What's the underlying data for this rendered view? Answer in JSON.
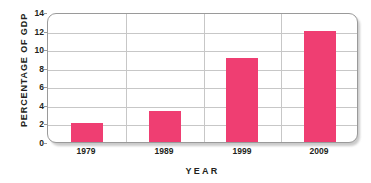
{
  "chart_data": {
    "type": "bar",
    "title": "",
    "categories": [
      "1979",
      "1989",
      "1999",
      "2009"
    ],
    "values": [
      2.0,
      3.3,
      9.0,
      12.0
    ],
    "xlabel": "YEAR",
    "ylabel": "PERCENTAGE OF GDP",
    "ylim": [
      0,
      14
    ],
    "yticks": [
      0,
      2,
      4,
      6,
      8,
      10,
      12,
      14
    ],
    "ytick_labels": [
      "0",
      "2",
      "4",
      "6",
      "8",
      "10",
      "12",
      "14"
    ],
    "grid": {
      "horizontal": true,
      "vertical": true,
      "vertical_count": 3
    },
    "legend": null,
    "series": [
      {
        "name": "Percentage of GDP",
        "values": [
          2.0,
          3.3,
          9.0,
          12.0
        ]
      }
    ],
    "colors": {
      "bar": "#ef3e72",
      "gridline": "#c7c7c7",
      "frame": "#9a9a9a",
      "text": "#231f20",
      "background": "#ffffff"
    }
  }
}
